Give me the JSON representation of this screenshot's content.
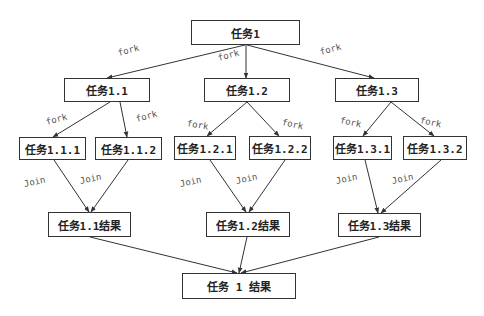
{
  "diagram": {
    "colors": {
      "line": "#333333",
      "box_border": "#333333",
      "text": "#222222",
      "label": "#555555"
    },
    "nodes": [
      {
        "id": "t1",
        "label": "任务1",
        "x": 191,
        "y": 20,
        "w": 109,
        "h": 25
      },
      {
        "id": "t1_1",
        "label": "任务1.1",
        "x": 64,
        "y": 78,
        "w": 86,
        "h": 24
      },
      {
        "id": "t1_2",
        "label": "任务1.2",
        "x": 204,
        "y": 78,
        "w": 86,
        "h": 24
      },
      {
        "id": "t1_3",
        "label": "任务1.3",
        "x": 335,
        "y": 78,
        "w": 84,
        "h": 24
      },
      {
        "id": "t1_1_1",
        "label": "任务1.1.1",
        "x": 19,
        "y": 137,
        "w": 67,
        "h": 23
      },
      {
        "id": "t1_1_2",
        "label": "任务1.1.2",
        "x": 95,
        "y": 137,
        "w": 67,
        "h": 23
      },
      {
        "id": "t1_2_1",
        "label": "任务1.2.1",
        "x": 174,
        "y": 136,
        "w": 62,
        "h": 24
      },
      {
        "id": "t1_2_2",
        "label": "任务1.2.2",
        "x": 249,
        "y": 136,
        "w": 62,
        "h": 24
      },
      {
        "id": "t1_3_1",
        "label": "任务1.3.1",
        "x": 333,
        "y": 136,
        "w": 59,
        "h": 24
      },
      {
        "id": "t1_3_2",
        "label": "任务1.3.2",
        "x": 403,
        "y": 136,
        "w": 64,
        "h": 24
      },
      {
        "id": "r1_1",
        "label": "任务1.1结果",
        "x": 48,
        "y": 212,
        "w": 83,
        "h": 25
      },
      {
        "id": "r1_2",
        "label": "任务1.2结果",
        "x": 206,
        "y": 212,
        "w": 84,
        "h": 25
      },
      {
        "id": "r1_3",
        "label": "任务1.3结果",
        "x": 338,
        "y": 213,
        "w": 83,
        "h": 24
      },
      {
        "id": "r1",
        "label": "任务 1 结果",
        "x": 182,
        "y": 273,
        "w": 114,
        "h": 26
      }
    ],
    "edges": [
      {
        "from": "t1",
        "to": "t1_1",
        "x1": 245,
        "y1": 45,
        "x2": 107,
        "y2": 78,
        "label": "fork",
        "lx": 118,
        "ly": 48,
        "rot": -15
      },
      {
        "from": "t1",
        "to": "t1_2",
        "x1": 246,
        "y1": 45,
        "x2": 246,
        "y2": 78,
        "label": "fork",
        "lx": 218,
        "ly": 53,
        "rot": -15
      },
      {
        "from": "t1",
        "to": "t1_3",
        "x1": 247,
        "y1": 45,
        "x2": 374,
        "y2": 78,
        "label": "fork",
        "lx": 320,
        "ly": 47,
        "rot": -15
      },
      {
        "from": "t1_1",
        "to": "t1_1_1",
        "x1": 110,
        "y1": 102,
        "x2": 53,
        "y2": 137,
        "label": "fork",
        "lx": 46,
        "ly": 117,
        "rot": -15
      },
      {
        "from": "t1_1",
        "to": "t1_1_2",
        "x1": 120,
        "y1": 102,
        "x2": 127,
        "y2": 137,
        "label": "fork",
        "lx": 136,
        "ly": 114,
        "rot": -15
      },
      {
        "from": "t1_2",
        "to": "t1_2_1",
        "x1": 247,
        "y1": 102,
        "x2": 207,
        "y2": 136,
        "label": "fork",
        "lx": 187,
        "ly": 118,
        "rot": 10
      },
      {
        "from": "t1_2",
        "to": "t1_2_2",
        "x1": 247,
        "y1": 102,
        "x2": 279,
        "y2": 136,
        "label": "fork",
        "lx": 282,
        "ly": 117,
        "rot": 12
      },
      {
        "from": "t1_3",
        "to": "t1_3_1",
        "x1": 391,
        "y1": 102,
        "x2": 363,
        "y2": 136,
        "label": "fork",
        "lx": 340,
        "ly": 115,
        "rot": 12
      },
      {
        "from": "t1_3",
        "to": "t1_3_2",
        "x1": 391,
        "y1": 102,
        "x2": 434,
        "y2": 136,
        "label": "fork",
        "lx": 420,
        "ly": 115,
        "rot": 12
      },
      {
        "from": "t1_1_1",
        "to": "r1_1",
        "x1": 54,
        "y1": 160,
        "x2": 89,
        "y2": 212,
        "label": "Join",
        "lx": 24,
        "ly": 179,
        "rot": -12
      },
      {
        "from": "t1_1_2",
        "to": "r1_1",
        "x1": 128,
        "y1": 160,
        "x2": 91,
        "y2": 212,
        "label": "Join",
        "lx": 80,
        "ly": 176,
        "rot": -12
      },
      {
        "from": "t1_2_1",
        "to": "r1_2",
        "x1": 210,
        "y1": 160,
        "x2": 246,
        "y2": 212,
        "label": "Join",
        "lx": 180,
        "ly": 179,
        "rot": -12
      },
      {
        "from": "t1_2_2",
        "to": "r1_2",
        "x1": 285,
        "y1": 160,
        "x2": 249,
        "y2": 212,
        "label": "Join",
        "lx": 236,
        "ly": 176,
        "rot": -12
      },
      {
        "from": "t1_3_1",
        "to": "r1_3",
        "x1": 365,
        "y1": 160,
        "x2": 378,
        "y2": 213,
        "label": "Join",
        "lx": 336,
        "ly": 176,
        "rot": -12
      },
      {
        "from": "t1_3_2",
        "to": "r1_3",
        "x1": 441,
        "y1": 160,
        "x2": 381,
        "y2": 213,
        "label": "Join",
        "lx": 392,
        "ly": 176,
        "rot": -12
      },
      {
        "from": "r1_1",
        "to": "r1",
        "x1": 90,
        "y1": 237,
        "x2": 237,
        "y2": 273,
        "label": ""
      },
      {
        "from": "r1_2",
        "to": "r1",
        "x1": 247,
        "y1": 237,
        "x2": 239,
        "y2": 273,
        "label": ""
      },
      {
        "from": "r1_3",
        "to": "r1",
        "x1": 379,
        "y1": 237,
        "x2": 241,
        "y2": 273,
        "label": ""
      }
    ]
  }
}
